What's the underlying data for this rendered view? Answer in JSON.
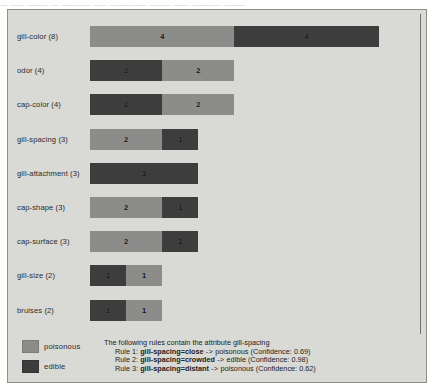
{
  "top_caption": "— —— ——— — ———— —— ————— ——— —— ———— ———",
  "colors": {
    "poisonous": "#8c8c8a",
    "edible": "#3d3d3d",
    "panel_background": "#d9d9d5",
    "panel_border": "#8e8e8a"
  },
  "legend": {
    "items": [
      {
        "label": "poisonous",
        "color": "#8c8c8a",
        "swatch_name": "legend-swatch-poisonous"
      },
      {
        "label": "edible",
        "color": "#3d3d3d",
        "swatch_name": "legend-swatch-edible"
      }
    ]
  },
  "rules_panel": {
    "heading": "The following rules contain the attribute gill-spacing",
    "rules": [
      {
        "prefix": "Rule 1: ",
        "antecedent": "gill-spacing=close",
        "arrow": " -> ",
        "consequent": "poisonous",
        "confidence": " (Confidence: 0.69)"
      },
      {
        "prefix": "Rule 2: ",
        "antecedent": "gill-spacing=crowded",
        "arrow": " -> ",
        "consequent": "edible",
        "confidence": " (Confidence: 0.98)"
      },
      {
        "prefix": "Rule 3: ",
        "antecedent": "gill-spacing=distant",
        "arrow": " -> ",
        "consequent": "poisonous",
        "confidence": " (Confidence: 0.62)"
      }
    ]
  },
  "chart_data": {
    "type": "bar",
    "orientation": "horizontal",
    "stacked": true,
    "title": "",
    "xlabel": "",
    "ylabel": "",
    "grid": false,
    "legend_position": "bottom-left",
    "xlim": [
      0,
      9
    ],
    "categories": [
      "gill-color (8)",
      "odor (4)",
      "cap-color (4)",
      "gill-spacing (3)",
      "gill-attachment (3)",
      "cap-shape (3)",
      "cap-surface (3)",
      "gill-size (2)",
      "bruises (2)"
    ],
    "series": [
      {
        "name": "poisonous",
        "color": "#8c8c8a",
        "values": [
          4,
          2,
          2,
          2,
          0,
          2,
          2,
          1,
          1
        ]
      },
      {
        "name": "edible",
        "color": "#3d3d3d",
        "values": [
          4,
          2,
          2,
          1,
          3,
          1,
          1,
          1,
          1
        ]
      }
    ],
    "rows": [
      {
        "label": "gill-color (8)",
        "total": 8,
        "segments": [
          {
            "class": "poisonous",
            "value": 4,
            "color": "#8c8c8a"
          },
          {
            "class": "edible",
            "value": 4,
            "color": "#3d3d3d"
          }
        ]
      },
      {
        "label": "odor (4)",
        "total": 4,
        "segments": [
          {
            "class": "edible",
            "value": 2,
            "color": "#3d3d3d"
          },
          {
            "class": "poisonous",
            "value": 2,
            "color": "#8c8c8a"
          }
        ]
      },
      {
        "label": "cap-color (4)",
        "total": 4,
        "segments": [
          {
            "class": "edible",
            "value": 2,
            "color": "#3d3d3d"
          },
          {
            "class": "poisonous",
            "value": 2,
            "color": "#8c8c8a"
          }
        ]
      },
      {
        "label": "gill-spacing (3)",
        "total": 3,
        "segments": [
          {
            "class": "poisonous",
            "value": 2,
            "color": "#8c8c8a"
          },
          {
            "class": "edible",
            "value": 1,
            "color": "#3d3d3d"
          }
        ]
      },
      {
        "label": "gill-attachment (3)",
        "total": 3,
        "segments": [
          {
            "class": "edible",
            "value": 3,
            "color": "#3d3d3d"
          }
        ]
      },
      {
        "label": "cap-shape (3)",
        "total": 3,
        "segments": [
          {
            "class": "poisonous",
            "value": 2,
            "color": "#8c8c8a"
          },
          {
            "class": "edible",
            "value": 1,
            "color": "#3d3d3d"
          }
        ]
      },
      {
        "label": "cap-surface (3)",
        "total": 3,
        "segments": [
          {
            "class": "poisonous",
            "value": 2,
            "color": "#8c8c8a"
          },
          {
            "class": "edible",
            "value": 1,
            "color": "#3d3d3d"
          }
        ]
      },
      {
        "label": "gill-size (2)",
        "total": 2,
        "segments": [
          {
            "class": "edible",
            "value": 1,
            "color": "#3d3d3d"
          },
          {
            "class": "poisonous",
            "value": 1,
            "color": "#8c8c8a"
          }
        ]
      },
      {
        "label": "bruises (2)",
        "total": 2,
        "segments": [
          {
            "class": "edible",
            "value": 1,
            "color": "#3d3d3d"
          },
          {
            "class": "poisonous",
            "value": 1,
            "color": "#8c8c8a"
          }
        ]
      }
    ]
  }
}
